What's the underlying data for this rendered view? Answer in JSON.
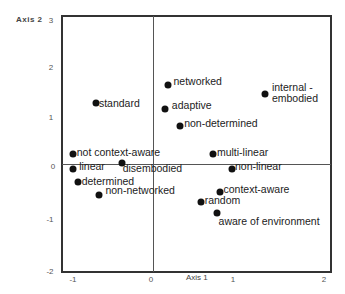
{
  "chart_data": {
    "type": "scatter",
    "title": "",
    "xlabel": "Axis 1",
    "ylabel": "Axis 2",
    "xlim": [
      -1.1,
      2.1
    ],
    "ylim": [
      -2,
      3
    ],
    "x_ticks": [
      "-1",
      "0",
      "1",
      "2"
    ],
    "y_ticks": [
      "3",
      "2",
      "1",
      "0",
      "-1",
      "-2"
    ],
    "grid": false,
    "zero_lines": true,
    "legend": null,
    "points": [
      {
        "label": "networked",
        "x": 0.18,
        "y": 1.55,
        "lx": 0.25,
        "ly": 1.6
      },
      {
        "label": "internal - embodied",
        "x": 1.37,
        "y": 1.37,
        "lx": 1.45,
        "ly": 1.5,
        "multiline": true
      },
      {
        "label": "standard",
        "x": -0.7,
        "y": 1.2,
        "lx": -0.66,
        "ly": 1.18
      },
      {
        "label": "adaptive",
        "x": 0.15,
        "y": 1.08,
        "lx": 0.23,
        "ly": 1.13
      },
      {
        "label": "non-determined",
        "x": 0.33,
        "y": 0.75,
        "lx": 0.38,
        "ly": 0.78
      },
      {
        "label": "not context-aware",
        "x": -0.98,
        "y": 0.2,
        "lx": -0.93,
        "ly": 0.21
      },
      {
        "label": "multi-linear",
        "x": 0.73,
        "y": 0.2,
        "lx": 0.78,
        "ly": 0.21
      },
      {
        "label": "disembodied",
        "x": -0.38,
        "y": 0.02,
        "lx": -0.37,
        "ly": -0.1
      },
      {
        "label": "linear",
        "x": -0.98,
        "y": -0.1,
        "lx": -0.9,
        "ly": -0.05
      },
      {
        "label": "non-linear",
        "x": 0.96,
        "y": -0.1,
        "lx": 1.0,
        "ly": -0.06
      },
      {
        "label": "determined",
        "x": -0.92,
        "y": -0.36,
        "lx": -0.87,
        "ly": -0.35
      },
      {
        "label": "context-aware",
        "x": 0.82,
        "y": -0.55,
        "lx": 0.86,
        "ly": -0.5
      },
      {
        "label": "non-networked",
        "x": -0.66,
        "y": -0.6,
        "lx": -0.58,
        "ly": -0.53
      },
      {
        "label": "random",
        "x": 0.58,
        "y": -0.74,
        "lx": 0.63,
        "ly": -0.72
      },
      {
        "label": "aware of environment",
        "x": 0.78,
        "y": -0.97,
        "lx": 0.8,
        "ly": -1.13
      }
    ]
  }
}
